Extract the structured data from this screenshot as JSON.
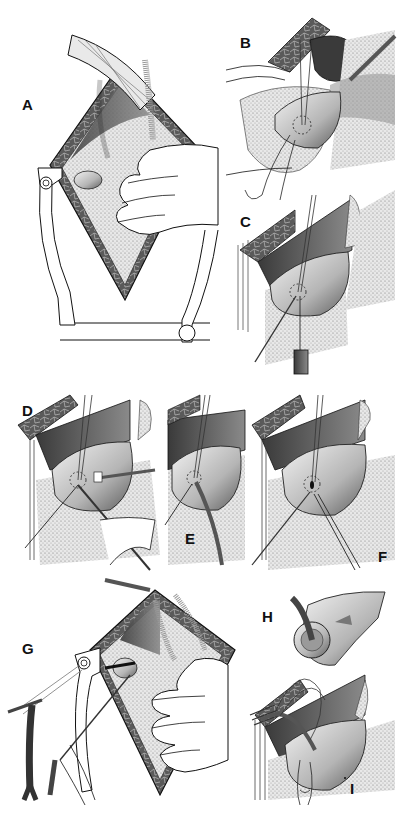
{
  "figure": {
    "panels": [
      {
        "id": "A",
        "label": "A"
      },
      {
        "id": "B",
        "label": "B"
      },
      {
        "id": "C",
        "label": "C"
      },
      {
        "id": "D",
        "label": "D"
      },
      {
        "id": "E",
        "label": "E"
      },
      {
        "id": "F",
        "label": "F"
      },
      {
        "id": "G",
        "label": "G"
      },
      {
        "id": "H",
        "label": "H"
      },
      {
        "id": "I",
        "label": "I"
      }
    ]
  },
  "colors": {
    "ink": "#111111",
    "tissue_dark": "#555555",
    "tissue_mid": "#8a8a8a",
    "tissue_light": "#c8c8c8",
    "stipple": "#bdbdbd",
    "background": "#ffffff"
  }
}
